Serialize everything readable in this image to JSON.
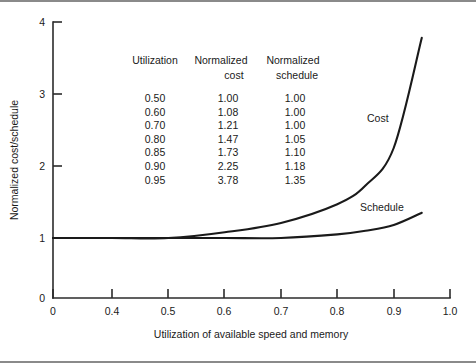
{
  "chart_data": {
    "type": "line",
    "title": "",
    "xlabel": "Utilization of available speed and memory",
    "ylabel": "Normalized cost/schedule",
    "xlim": [
      0.0,
      1.0
    ],
    "ylim": [
      0,
      4
    ],
    "grid": false,
    "legend": "inline-curve-labels",
    "xticks": [
      "0",
      "0.4",
      "0.5",
      "0.6",
      "0.7",
      "0.8",
      "0.9",
      "1.0"
    ],
    "xtick_values": [
      0.0,
      0.4,
      0.5,
      0.6,
      0.7,
      0.8,
      0.9,
      1.0
    ],
    "yticks": [
      "0",
      "1",
      "2",
      "3",
      "4"
    ],
    "ytick_values": [
      0,
      1,
      2,
      3,
      4
    ],
    "x": [
      0.0,
      0.4,
      0.5,
      0.6,
      0.7,
      0.8,
      0.85,
      0.9,
      0.95
    ],
    "series": [
      {
        "name": "Cost",
        "label": "Cost",
        "values": [
          1.0,
          1.0,
          1.0,
          1.08,
          1.21,
          1.47,
          1.73,
          2.25,
          3.78
        ]
      },
      {
        "name": "Schedule",
        "label": "Schedule",
        "values": [
          1.0,
          1.0,
          1.0,
          1.0,
          1.0,
          1.05,
          1.1,
          1.18,
          1.35
        ]
      }
    ],
    "annotations": [
      {
        "text": "Cost",
        "x": 0.86,
        "y": 2.45
      },
      {
        "text": "Schedule",
        "x": 0.83,
        "y": 1.25
      }
    ],
    "table": {
      "headers": [
        "Utilization",
        "Normalized cost",
        "Normalized schedule"
      ],
      "header_lines": [
        [
          "Utilization",
          "Normalized",
          "Normalized"
        ],
        [
          "",
          "cost",
          "schedule"
        ]
      ],
      "rows": [
        [
          "0.50",
          "1.00",
          "1.00"
        ],
        [
          "0.60",
          "1.08",
          "1.00"
        ],
        [
          "0.70",
          "1.21",
          "1.00"
        ],
        [
          "0.80",
          "1.47",
          "1.05"
        ],
        [
          "0.85",
          "1.73",
          "1.10"
        ],
        [
          "0.90",
          "2.25",
          "1.18"
        ],
        [
          "0.95",
          "3.78",
          "1.35"
        ]
      ]
    },
    "colors": {
      "curve": "#1a1a1a",
      "axis": "#2b2b2b",
      "rule": "#8a8a8a",
      "background": "#ffffff"
    }
  }
}
